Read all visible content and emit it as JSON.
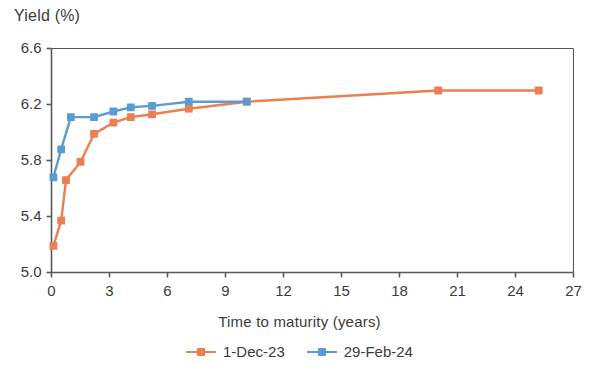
{
  "chart_data": {
    "type": "line",
    "title": "",
    "xlabel": "Time to maturity (years)",
    "ylabel": "Yield (%)",
    "xlim": [
      0,
      27
    ],
    "ylim": [
      5.0,
      6.6
    ],
    "xticks": [
      0,
      3,
      6,
      9,
      12,
      15,
      18,
      21,
      24,
      27
    ],
    "yticks": [
      5.0,
      5.4,
      5.8,
      6.2,
      6.6
    ],
    "xtick_labels": [
      "0",
      "3",
      "6",
      "9",
      "12",
      "15",
      "18",
      "21",
      "24",
      "27"
    ],
    "ytick_labels": [
      "5.0",
      "5.4",
      "5.8",
      "6.2",
      "6.6"
    ],
    "grid": false,
    "legend_position": "bottom",
    "markers": "square",
    "series": [
      {
        "name": "1-Dec-23",
        "color": "#ED7D52",
        "x": [
          0.1,
          0.5,
          0.75,
          1.5,
          2.2,
          3.2,
          4.1,
          5.2,
          7.1,
          10.1,
          20.0,
          25.2
        ],
        "y": [
          5.19,
          5.37,
          5.66,
          5.79,
          5.99,
          6.07,
          6.11,
          6.13,
          6.17,
          6.22,
          6.3,
          6.3
        ]
      },
      {
        "name": "29-Feb-24",
        "color": "#5B9BD5",
        "x": [
          0.1,
          0.5,
          1.0,
          2.2,
          3.2,
          4.1,
          5.2,
          7.1,
          10.1
        ],
        "y": [
          5.68,
          5.88,
          6.11,
          6.11,
          6.15,
          6.18,
          6.19,
          6.22,
          6.22
        ]
      }
    ]
  },
  "legend": {
    "entries": [
      {
        "label": "1-Dec-23",
        "color": "#ED7D52"
      },
      {
        "label": "29-Feb-24",
        "color": "#5B9BD5"
      }
    ]
  },
  "axes": {
    "y_title": "Yield (%)",
    "x_title": "Time to maturity (years)"
  }
}
